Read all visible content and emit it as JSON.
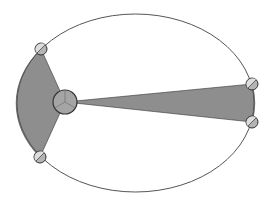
{
  "diagram": {
    "colors": {
      "background": "#ffffff",
      "orbit_stroke": "#555555",
      "sector_fill": "#8e8e8e",
      "sun_fill": "#a5a5a5",
      "planet_fill": "#b4b4b4",
      "planet_highlight": "#e6e6e6",
      "outline": "#333333"
    },
    "orbit": {
      "cx": 135.5,
      "cy": 103,
      "rx": 118.5,
      "ry": 89
    },
    "sun": {
      "cx": 65,
      "cy": 102,
      "r": 12
    },
    "planets": [
      {
        "id": "aphelion-start",
        "cx": 41,
        "cy": 49,
        "r": 6
      },
      {
        "id": "aphelion-end",
        "cx": 40,
        "cy": 157,
        "r": 6
      },
      {
        "id": "perihelion-start",
        "cx": 252,
        "cy": 84,
        "r": 6
      },
      {
        "id": "perihelion-end",
        "cx": 252,
        "cy": 122,
        "r": 6
      }
    ],
    "sectors": [
      {
        "id": "wide-sector",
        "from": 0,
        "to": 1
      },
      {
        "id": "narrow-sector",
        "from": 2,
        "to": 3
      }
    ]
  }
}
